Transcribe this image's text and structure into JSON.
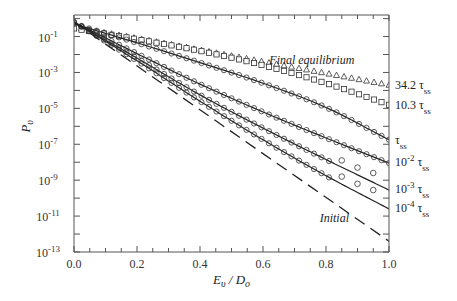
{
  "chart_data": {
    "type": "line",
    "title": "",
    "xlabel": "E_v / D_o",
    "ylabel": "P_v",
    "xlim": [
      0.0,
      1.0
    ],
    "ylim_log10": [
      -13,
      0.2
    ],
    "yscale": "log",
    "grid": false,
    "legend": null,
    "x_ticks": [
      "0.0",
      "0.2",
      "0.4",
      "0.6",
      "0.8",
      "1.0"
    ],
    "y_ticks": [
      {
        "base": "10",
        "exp": "-1",
        "log": -1
      },
      {
        "base": "10",
        "exp": "-3",
        "log": -3
      },
      {
        "base": "10",
        "exp": "-5",
        "log": -5
      },
      {
        "base": "10",
        "exp": "-7",
        "log": -7
      },
      {
        "base": "10",
        "exp": "-9",
        "log": -9
      },
      {
        "base": "10",
        "exp": "-11",
        "log": -11
      },
      {
        "base": "10",
        "exp": "-13",
        "log": -13
      }
    ],
    "annotations": [
      {
        "text": "Final equilibrium",
        "x": 0.62,
        "log_y": -2.55,
        "italic": true
      },
      {
        "text": "Initial",
        "x": 0.78,
        "log_y": -11.35,
        "italic": true
      }
    ],
    "series": [
      {
        "name": "Final equilibrium",
        "style": "triangles",
        "label": "34.2",
        "label_log_y": -3.7,
        "x": [
          0.0,
          0.2,
          0.4,
          0.6,
          0.8,
          1.0
        ],
        "log_y": [
          -0.5,
          -1.1,
          -1.75,
          -2.4,
          -3.05,
          -3.7
        ]
      },
      {
        "name": "10.3 tau_ss",
        "style": "squares",
        "label": "10.3",
        "label_log_y": -4.8,
        "x": [
          0.0,
          0.2,
          0.4,
          0.6,
          0.8,
          1.0
        ],
        "log_y": [
          -0.55,
          -1.15,
          -1.8,
          -2.6,
          -3.6,
          -4.8
        ]
      },
      {
        "name": "tau_ss",
        "style": "circles+line",
        "label": "",
        "label_log_y": -6.75,
        "x": [
          0.0,
          0.2,
          0.4,
          0.6,
          0.8,
          1.0
        ],
        "log_y": [
          -0.3,
          -1.35,
          -2.45,
          -3.6,
          -4.95,
          -6.75
        ]
      },
      {
        "name": "1e-2 tau_ss",
        "style": "circles+line",
        "label": "10",
        "label_exp": "-2",
        "label_log_y": -8.0,
        "x": [
          0.0,
          0.2,
          0.4,
          0.6,
          0.8,
          1.0
        ],
        "log_y": [
          -0.2,
          -1.95,
          -3.65,
          -5.2,
          -6.65,
          -8.05
        ]
      },
      {
        "name": "1e-3 tau_ss",
        "style": "circles+line",
        "label": "10",
        "label_exp": "-3",
        "label_log_y": -9.5,
        "x": [
          0.0,
          0.2,
          0.4,
          0.6,
          0.8,
          1.0
        ],
        "log_y": [
          -0.2,
          -2.2,
          -4.25,
          -6.1,
          -7.85,
          -9.55
        ],
        "circles_log_y_tail": [
          [
            0.85,
            -7.9
          ],
          [
            0.9,
            -8.3
          ],
          [
            0.95,
            -8.6
          ]
        ]
      },
      {
        "name": "1e-4 tau_ss",
        "style": "circles+line",
        "label": "10",
        "label_exp": "-4",
        "label_log_y": -10.55,
        "x": [
          0.0,
          0.2,
          0.4,
          0.6,
          0.8,
          1.0
        ],
        "log_y": [
          -0.2,
          -2.35,
          -4.6,
          -6.75,
          -8.75,
          -10.6
        ],
        "circles_log_y_tail": [
          [
            0.85,
            -8.8
          ],
          [
            0.9,
            -9.2
          ],
          [
            0.95,
            -9.55
          ]
        ]
      },
      {
        "name": "Initial",
        "style": "dashed",
        "label": "",
        "label_log_y": null,
        "x": [
          0.0,
          1.0
        ],
        "log_y": [
          -0.2,
          -12.4
        ]
      }
    ]
  },
  "ui": {
    "xlabel_main": "E",
    "xlabel_sub1": "υ",
    "xlabel_slash": " / D",
    "xlabel_sub2": "o",
    "ylabel_main": "P",
    "ylabel_sub": "υ",
    "tau": "τ",
    "tau_sub": "ss"
  }
}
